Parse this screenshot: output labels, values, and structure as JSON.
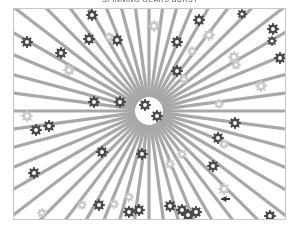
{
  "title": {
    "text": "SPINNING GEARS BURST"
  },
  "scene": {
    "background": "#ffffff",
    "frame": {
      "x": 13,
      "y": 8,
      "width": 271,
      "height": 210,
      "border": "#c8c8c8"
    },
    "burst": {
      "center_x": 135,
      "center_y": 102,
      "ray_count": 48,
      "ray_color": "#a8a8a8",
      "ray_width": 3.2
    },
    "gears": [
      {
        "x": 78,
        "y": 6,
        "r": 6,
        "shade": "dark"
      },
      {
        "x": 140,
        "y": 17,
        "r": 6,
        "shade": "light"
      },
      {
        "x": 185,
        "y": 11,
        "r": 6,
        "shade": "dark"
      },
      {
        "x": 228,
        "y": 5,
        "r": 5,
        "shade": "dark"
      },
      {
        "x": 259,
        "y": 20,
        "r": 6,
        "shade": "dark"
      },
      {
        "x": 13,
        "y": 33,
        "r": 6,
        "shade": "dark"
      },
      {
        "x": 75,
        "y": 30,
        "r": 6,
        "shade": "dark"
      },
      {
        "x": 103,
        "y": 31,
        "r": 6,
        "shade": "dark"
      },
      {
        "x": 95,
        "y": 28,
        "r": 5,
        "shade": "light"
      },
      {
        "x": 163,
        "y": 33,
        "r": 6,
        "shade": "dark"
      },
      {
        "x": 195,
        "y": 26,
        "r": 6,
        "shade": "light"
      },
      {
        "x": 47,
        "y": 44,
        "r": 6,
        "shade": "dark"
      },
      {
        "x": 55,
        "y": 61,
        "r": 6,
        "shade": "light"
      },
      {
        "x": 178,
        "y": 42,
        "r": 5,
        "shade": "light"
      },
      {
        "x": 163,
        "y": 62,
        "r": 6,
        "shade": "dark"
      },
      {
        "x": 258,
        "y": 32,
        "r": 5,
        "shade": "dark"
      },
      {
        "x": 220,
        "y": 48,
        "r": 6,
        "shade": "light"
      },
      {
        "x": 266,
        "y": 49,
        "r": 6,
        "shade": "dark"
      },
      {
        "x": 170,
        "y": 70,
        "r": 5,
        "shade": "light"
      },
      {
        "x": 222,
        "y": 56,
        "r": 5,
        "shade": "light"
      },
      {
        "x": 247,
        "y": 77,
        "r": 6,
        "shade": "light"
      },
      {
        "x": 80,
        "y": 93,
        "r": 6,
        "shade": "dark"
      },
      {
        "x": 106,
        "y": 93,
        "r": 6,
        "shade": "dark"
      },
      {
        "x": 131,
        "y": 96,
        "r": 6,
        "shade": "dark"
      },
      {
        "x": 143,
        "y": 107,
        "r": 6,
        "shade": "dark"
      },
      {
        "x": 205,
        "y": 95,
        "r": 5,
        "shade": "light"
      },
      {
        "x": 13,
        "y": 107,
        "r": 6,
        "shade": "light"
      },
      {
        "x": 22,
        "y": 121,
        "r": 6,
        "shade": "dark"
      },
      {
        "x": 35,
        "y": 117,
        "r": 6,
        "shade": "dark"
      },
      {
        "x": 221,
        "y": 114,
        "r": 6,
        "shade": "dark"
      },
      {
        "x": 204,
        "y": 129,
        "r": 6,
        "shade": "dark"
      },
      {
        "x": 210,
        "y": 135,
        "r": 5,
        "shade": "light"
      },
      {
        "x": 88,
        "y": 143,
        "r": 6,
        "shade": "dark"
      },
      {
        "x": 128,
        "y": 145,
        "r": 6,
        "shade": "dark"
      },
      {
        "x": 168,
        "y": 145,
        "r": 5,
        "shade": "light"
      },
      {
        "x": 156,
        "y": 155,
        "r": 5,
        "shade": "light"
      },
      {
        "x": 199,
        "y": 157,
        "r": 6,
        "shade": "dark"
      },
      {
        "x": 20,
        "y": 164,
        "r": 6,
        "shade": "dark"
      },
      {
        "x": 210,
        "y": 180,
        "r": 6,
        "shade": "light"
      },
      {
        "x": 115,
        "y": 188,
        "r": 5,
        "shade": "light"
      },
      {
        "x": 100,
        "y": 195,
        "r": 5,
        "shade": "light"
      },
      {
        "x": 85,
        "y": 196,
        "r": 6,
        "shade": "dark"
      },
      {
        "x": 68,
        "y": 196,
        "r": 5,
        "shade": "light"
      },
      {
        "x": 156,
        "y": 197,
        "r": 6,
        "shade": "dark"
      },
      {
        "x": 168,
        "y": 201,
        "r": 6,
        "shade": "dark"
      },
      {
        "x": 174,
        "y": 206,
        "r": 6,
        "shade": "dark"
      },
      {
        "x": 182,
        "y": 203,
        "r": 6,
        "shade": "dark"
      },
      {
        "x": 115,
        "y": 203,
        "r": 6,
        "shade": "dark"
      },
      {
        "x": 125,
        "y": 201,
        "r": 6,
        "shade": "dark"
      },
      {
        "x": 28,
        "y": 204,
        "r": 5,
        "shade": "light"
      },
      {
        "x": 256,
        "y": 207,
        "r": 6,
        "shade": "dark"
      }
    ],
    "pointer": {
      "x": 206,
      "y": 190,
      "icon": "pointer-arrow-icon"
    },
    "colors": {
      "gear_dark": "#4a4a4a",
      "gear_light": "#c9c9c9"
    }
  }
}
